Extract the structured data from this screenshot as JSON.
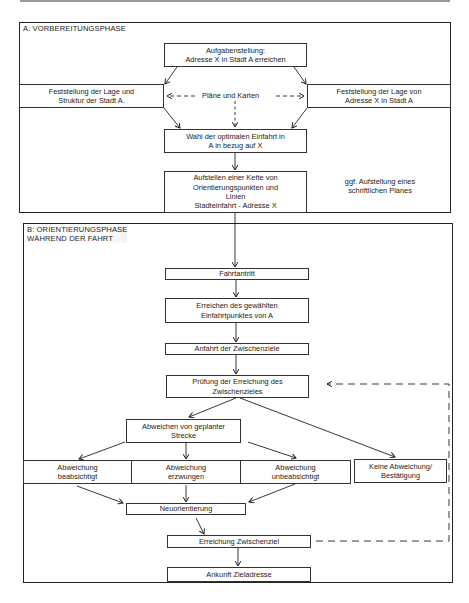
{
  "diagram": {
    "section_a": {
      "title": "A: VORBEREITUNGSPHASE",
      "nodes": {
        "aufgabe": "Aufgabenstellung:\nAdresse X in Stadt A erreichen",
        "lage_stadt": "Feststellung der Lage und\nStruktur der Stadt A.",
        "plaene": "Pläne und Karten",
        "lage_adresse": "Feststellung der Lage von\nAdresse X in Stadt A",
        "wahl": "Wahl der optimalen Einfahrt in\nA in bezug auf X",
        "kette": "Aufstellen einer Kette von\nOrientierungspunkten und\nLinien\nStadteinfahrt - Adresse X",
        "note": "ggf. Aufstellung eines\nschriftlichen Planes"
      }
    },
    "section_b": {
      "title": "B: ORIENTIERUNGSPHASE\nWÄHREND DER FAHRT",
      "nodes": {
        "fahrtantritt": "Fahrtantritt",
        "erreichen_einfahrt": "Erreichen des gewählten\nEinfahrtpunktes von A",
        "anfahrt": "Anfahrt der Zwischenziele",
        "pruefung": "Prüfung der Erreichung des\nZwischenzieles",
        "abweichen": "Abweichen von geplanter\nStrecke",
        "abw_beabsichtigt": "Abweichung\nbeabsichtigt",
        "abw_erzwungen": "Abweichung\nerzwungen",
        "abw_unbeabsichtigt": "Abweichung\nunbeabsichtigt",
        "keine_abweichung": "Keine Abweichung/\nBestätigung",
        "neuorientierung": "Neuorientierung",
        "erreichung_zwischenziel": "Erreichung Zwischenziel",
        "ankunft": "Ankunft Zieladresse"
      }
    },
    "edges": [
      {
        "from": "aufgabe",
        "to": "lage_stadt",
        "style": "solid"
      },
      {
        "from": "aufgabe",
        "to": "lage_adresse",
        "style": "solid"
      },
      {
        "from": "plaene",
        "to": "lage_stadt",
        "style": "dashed"
      },
      {
        "from": "plaene",
        "to": "lage_adresse",
        "style": "dashed"
      },
      {
        "from": "plaene",
        "to": "wahl",
        "style": "dashed"
      },
      {
        "from": "lage_stadt",
        "to": "wahl",
        "style": "solid"
      },
      {
        "from": "lage_adresse",
        "to": "wahl",
        "style": "solid"
      },
      {
        "from": "wahl",
        "to": "kette",
        "style": "solid"
      },
      {
        "from": "kette",
        "to": "fahrtantritt",
        "style": "solid"
      },
      {
        "from": "fahrtantritt",
        "to": "erreichen_einfahrt",
        "style": "solid"
      },
      {
        "from": "erreichen_einfahrt",
        "to": "anfahrt",
        "style": "solid"
      },
      {
        "from": "anfahrt",
        "to": "pruefung",
        "style": "solid"
      },
      {
        "from": "pruefung",
        "to": "abweichen",
        "style": "solid"
      },
      {
        "from": "pruefung",
        "to": "keine_abweichung",
        "style": "solid"
      },
      {
        "from": "abweichen",
        "to": "abw_beabsichtigt",
        "style": "solid"
      },
      {
        "from": "abweichen",
        "to": "abw_erzwungen",
        "style": "solid"
      },
      {
        "from": "abweichen",
        "to": "abw_unbeabsichtigt",
        "style": "solid"
      },
      {
        "from": "abw_beabsichtigt",
        "to": "neuorientierung",
        "style": "solid"
      },
      {
        "from": "abw_erzwungen",
        "to": "neuorientierung",
        "style": "solid"
      },
      {
        "from": "abw_unbeabsichtigt",
        "to": "neuorientierung",
        "style": "solid"
      },
      {
        "from": "neuorientierung",
        "to": "erreichung_zwischenziel",
        "style": "solid"
      },
      {
        "from": "erreichung_zwischenziel",
        "to": "pruefung",
        "style": "dashed"
      },
      {
        "from": "erreichung_zwischenziel",
        "to": "ankunft",
        "style": "solid"
      }
    ],
    "colors": {
      "line": "#222222",
      "box_border": "#333333",
      "background": "#ffffff",
      "top_rule": "#9a9a9a"
    }
  }
}
